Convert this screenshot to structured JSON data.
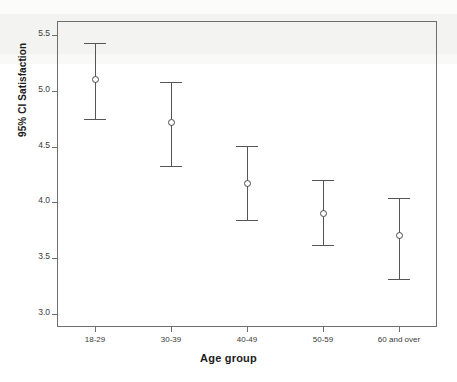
{
  "chart_data": {
    "type": "scatter",
    "title": "",
    "xlabel": "Age group",
    "ylabel": "95% CI Satisfaction",
    "categories": [
      "18-29",
      "30-39",
      "40-49",
      "50-59",
      "60 and over"
    ],
    "values": [
      5.1,
      4.72,
      4.17,
      3.9,
      3.7
    ],
    "ci_lower": [
      4.75,
      4.33,
      3.84,
      3.62,
      3.31
    ],
    "ci_upper": [
      5.43,
      5.08,
      4.51,
      4.2,
      4.04
    ],
    "ylim": [
      2.88,
      5.63
    ],
    "yticks": [
      "3.0",
      "3.5",
      "4.0",
      "4.5",
      "5.0",
      "5.5"
    ],
    "ytick_values": [
      3.0,
      3.5,
      4.0,
      4.5,
      5.0,
      5.5
    ],
    "grid": false,
    "legend": "none",
    "series": [
      {
        "name": "Mean satisfaction with 95% confidence interval",
        "values": [
          5.1,
          4.72,
          4.17,
          3.9,
          3.7
        ]
      }
    ],
    "marker": "open-circle",
    "line_color": "#555555",
    "frame_color": "#6e6e6e"
  },
  "axes": {
    "y_title": "95% CI Satisfaction",
    "x_title": "Age group"
  }
}
